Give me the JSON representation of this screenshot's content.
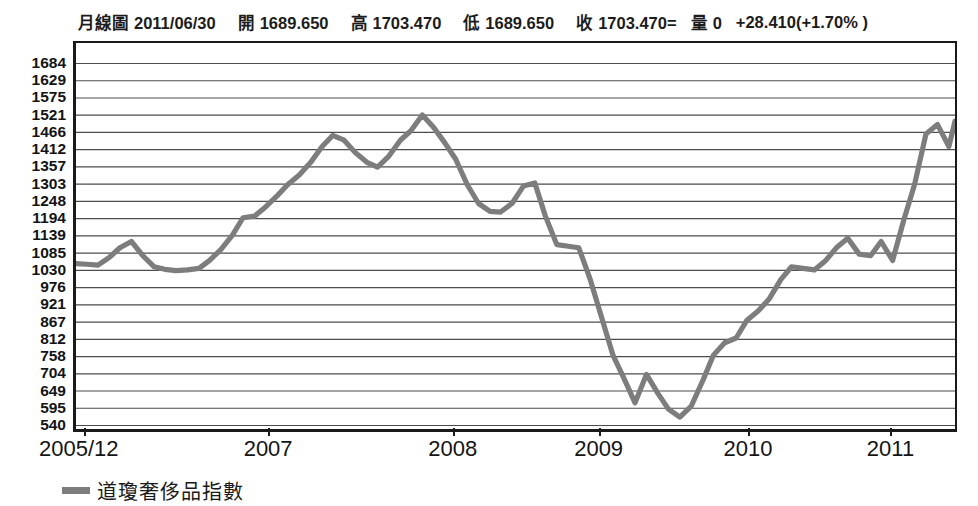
{
  "quote": {
    "chart_type_label": "月線圖",
    "date": "2011/06/30",
    "open_label": "開",
    "open_value": "1689.650",
    "high_label": "高",
    "high_value": "1703.470",
    "low_label": "低",
    "low_value": "1689.650",
    "close_label": "收",
    "close_value": "1703.470=",
    "volume_label": "量",
    "volume_value": "0",
    "change": "+28.410(+1.70% )"
  },
  "legend": {
    "series_label": "道瓊奢侈品指數",
    "series_color": "#7d7d7d"
  },
  "colors": {
    "line": "#7d7d7d",
    "grid": "#4d4d4d",
    "axis": "#1a1a1a",
    "background": "#ffffff"
  },
  "chart_data": {
    "type": "line",
    "title": "",
    "subtitle": "",
    "xlabel": "",
    "ylabel": "",
    "grid": true,
    "legend_position": "bottom-left",
    "ylim": [
      540,
      1684
    ],
    "ytick_labels": [
      1684,
      1629,
      1575,
      1521,
      1466,
      1412,
      1357,
      1303,
      1248,
      1194,
      1139,
      1085,
      1030,
      976,
      921,
      867,
      812,
      758,
      704,
      649,
      595,
      540
    ],
    "xtick_labels": [
      "2005/12",
      "2007",
      "2008",
      "2009",
      "2010",
      "2011"
    ],
    "xtick_positions_frac": [
      0.012,
      0.222,
      0.432,
      0.598,
      0.768,
      0.93
    ],
    "series": [
      {
        "name": "道瓊奢侈品指數",
        "color": "#7d7d7d",
        "x": [
          0.0,
          0.012,
          0.025,
          0.038,
          0.05,
          0.063,
          0.076,
          0.089,
          0.101,
          0.114,
          0.127,
          0.14,
          0.152,
          0.165,
          0.178,
          0.19,
          0.203,
          0.216,
          0.229,
          0.241,
          0.254,
          0.267,
          0.28,
          0.292,
          0.305,
          0.318,
          0.331,
          0.343,
          0.356,
          0.369,
          0.381,
          0.394,
          0.407,
          0.42,
          0.432,
          0.445,
          0.458,
          0.471,
          0.483,
          0.496,
          0.509,
          0.522,
          0.534,
          0.547,
          0.56,
          0.572,
          0.585,
          0.598,
          0.611,
          0.623,
          0.636,
          0.649,
          0.662,
          0.674,
          0.687,
          0.7,
          0.713,
          0.725,
          0.738,
          0.751,
          0.763,
          0.776,
          0.789,
          0.802,
          0.814,
          0.827,
          0.84,
          0.853,
          0.865,
          0.878,
          0.891,
          0.904,
          0.916,
          0.929,
          0.942,
          0.954,
          0.967,
          0.98,
          0.993,
          1.0
        ],
        "y": [
          1050,
          1048,
          1045,
          1070,
          1100,
          1120,
          1075,
          1040,
          1032,
          1028,
          1030,
          1035,
          1060,
          1095,
          1140,
          1195,
          1200,
          1230,
          1265,
          1300,
          1330,
          1370,
          1420,
          1455,
          1440,
          1400,
          1370,
          1355,
          1390,
          1440,
          1470,
          1520,
          1480,
          1430,
          1380,
          1300,
          1240,
          1215,
          1213,
          1240,
          1295,
          1305,
          1200,
          1110,
          1105,
          1100,
          1000,
          880,
          760,
          690,
          610,
          700,
          640,
          590,
          565,
          600,
          680,
          760,
          800,
          815,
          870,
          900,
          940,
          1000,
          1040,
          1035,
          1030,
          1060,
          1100,
          1130,
          1080,
          1075,
          1120,
          1060,
          1190,
          1300,
          1460,
          1490,
          1420,
          1500
        ],
        "key_points": {
          "start_2005_12": 1050,
          "peak_2007_mid": 1455,
          "peak_2007_late": 1520,
          "shoulder_2008_q3": 1305,
          "trough_2009_q1": 565,
          "local_bounce_2009": 700,
          "recovery_2010": 1130,
          "dip_2010_mid": 1060,
          "end_2011_06": 1690
        }
      }
    ]
  }
}
